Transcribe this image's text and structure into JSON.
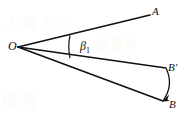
{
  "figure": {
    "background_color": "#ffffff",
    "stroke_color": "#111111",
    "labels": {
      "vertex": "O",
      "ray_a_end": "A",
      "ray_bprime_end": "B'",
      "ray_b_end": "B",
      "angle_symbol": "β",
      "angle_subscript": "1"
    },
    "watermark": {
      "line1": "上海 市政",
      "line2": "测量学",
      "line3": "图例"
    },
    "geometry": {
      "vertex": [
        18,
        47
      ],
      "ray_a": [
        150,
        15
      ],
      "ray_bprime": [
        166,
        68
      ],
      "ray_b": [
        163,
        101
      ],
      "angle_arc_x": 70,
      "angle_arc_top": [
        70,
        35.3
      ],
      "angle_arc_bottom": [
        70,
        58.1
      ],
      "rotation_arc_from": [
        166,
        68
      ],
      "rotation_arc_to": [
        163,
        101
      ],
      "rotation_arc_control": [
        176,
        85
      ],
      "arrow_tip": [
        162.5,
        101
      ]
    }
  }
}
